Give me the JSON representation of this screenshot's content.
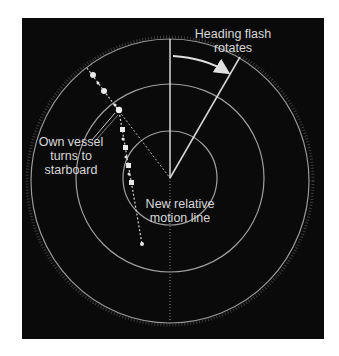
{
  "diagram": {
    "colors": {
      "background": "#0a0a0a",
      "rings": "#9a9a9a",
      "lines": "#d0d0d0",
      "text": "#d8d8d8"
    },
    "labels": {
      "heading_flash": {
        "line1": "Heading flash",
        "line2": "rotates"
      },
      "own_vessel": {
        "line1": "Own vessel",
        "line2": "turns to",
        "line3": "starboard"
      },
      "relative_motion": {
        "line1": "New relative",
        "line2": "motion line"
      }
    },
    "geometry": {
      "center": [
        170,
        178
      ],
      "rings": [
        {
          "name": "inner-range-ring",
          "radius": 47
        },
        {
          "name": "middle-range-ring",
          "radius": 94
        },
        {
          "name": "outer-range-ring",
          "rx": 140,
          "ry": 142
        }
      ],
      "original_heading_line": {
        "from": [
          170,
          178
        ],
        "to": [
          170,
          38
        ]
      },
      "rotated_heading_line": {
        "from": [
          170,
          178
        ],
        "to": [
          240,
          57
        ]
      },
      "old_track_points": [
        [
          93,
          75
        ],
        [
          104,
          91
        ],
        [
          119,
          110
        ]
      ],
      "new_track_points": [
        [
          119,
          111
        ],
        [
          122,
          130
        ],
        [
          125,
          148
        ],
        [
          128,
          166
        ],
        [
          131,
          183
        ]
      ],
      "relative_motion_end": [
        142,
        244
      ]
    }
  }
}
